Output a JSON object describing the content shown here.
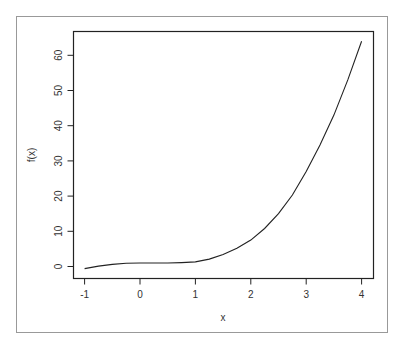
{
  "chart_data": {
    "type": "line",
    "title": "",
    "xlabel": "x",
    "ylabel": "f(x)",
    "xlim": [
      -1.2,
      4.2
    ],
    "ylim": [
      -3.4,
      66.8
    ],
    "x_ticks": [
      -1,
      0,
      1,
      2,
      3,
      4
    ],
    "y_ticks": [
      0,
      10,
      20,
      30,
      40,
      50,
      60
    ],
    "grid": false,
    "legend": null,
    "series": [
      {
        "name": "f(x)",
        "color": "#222222",
        "x": [
          -1,
          -0.75,
          -0.5,
          -0.25,
          0,
          0.25,
          0.5,
          0.75,
          1,
          1.25,
          1.5,
          1.75,
          2,
          2.25,
          2.5,
          2.75,
          3,
          3.25,
          3.5,
          3.75,
          4
        ],
        "y": [
          -0.6,
          0.1,
          0.6,
          0.9,
          1.0,
          1.0,
          1.0,
          1.1,
          1.3,
          2.1,
          3.4,
          5.2,
          7.5,
          10.8,
          15.0,
          20.3,
          27.0,
          34.5,
          43.0,
          53.0,
          64.0
        ]
      }
    ]
  },
  "colors": {
    "frame": "#888888",
    "box": "#222222",
    "line": "#222222",
    "text": "#333333"
  }
}
